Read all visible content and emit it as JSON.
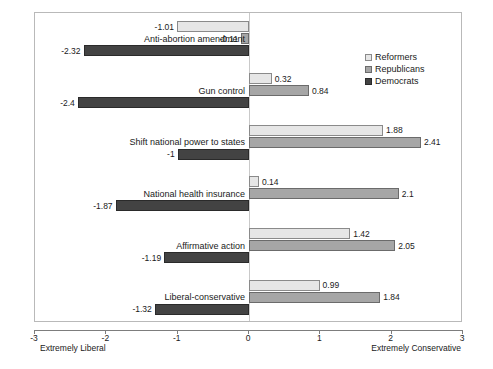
{
  "chart_data": {
    "type": "bar",
    "orientation": "horizontal",
    "title": "",
    "subtitle": "",
    "xlabel": "",
    "ylabel": "",
    "xlim": [
      -3,
      3
    ],
    "xticks": [
      -3,
      -2,
      -1,
      0,
      1,
      2,
      3
    ],
    "xtick_labels": [
      "-3",
      "-2",
      "-1",
      "0",
      "1",
      "2",
      "3"
    ],
    "grid": false,
    "zero_line": true,
    "axis_end_labels": {
      "left": "Extremely Liberal",
      "right": "Extremely Conservative"
    },
    "legend_position": "upper right",
    "categories": [
      "Anti-abortion amendment",
      "Gun control",
      "Shift national power to states",
      "National health insurance",
      "Affirmative action",
      "Liberal-conservative"
    ],
    "series": [
      {
        "name": "Reformers",
        "color": "#e6e6e6",
        "values": [
          -1.01,
          0.32,
          1.88,
          0.14,
          1.42,
          0.99
        ],
        "value_labels": [
          "-1.01",
          "0.32",
          "1.88",
          "0.14",
          "1.42",
          "0.99"
        ]
      },
      {
        "name": "Republicans",
        "color": "#a6a6a6",
        "values": [
          -0.11,
          0.84,
          2.41,
          2.1,
          2.05,
          1.84
        ],
        "value_labels": [
          "-0.11",
          "0.84",
          "2.41",
          "2.1",
          "2.05",
          "1.84"
        ]
      },
      {
        "name": "Democrats",
        "color": "#434343",
        "values": [
          -2.32,
          -2.4,
          -1,
          -1.87,
          -1.19,
          -1.32
        ],
        "value_labels": [
          "-2.32",
          "-2.4",
          "-1",
          "-1.87",
          "-1.19",
          "-1.32"
        ]
      }
    ]
  },
  "legend": {
    "items": [
      {
        "label": "Reformers",
        "key": "reformers"
      },
      {
        "label": "Republicans",
        "key": "republicans"
      },
      {
        "label": "Democrats",
        "key": "democrats"
      }
    ]
  }
}
